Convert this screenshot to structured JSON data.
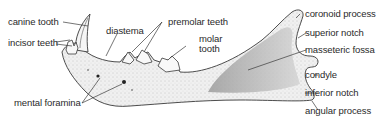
{
  "diagram": {
    "colors": {
      "bone_fill": "#ededed",
      "bone_stroke": "#3a3a3a",
      "fossa_shade": "#b8b8b8",
      "text": "#2a2a2a",
      "leader": "#3a3a3a"
    },
    "labels": {
      "canine_tooth": "canine tooth",
      "incisor_teeth": "incisor teeth",
      "diastema": "diastema",
      "premolar_teeth": "premolar teeth",
      "molar_tooth_line1": "molar",
      "molar_tooth_line2": "tooth",
      "mental_foramina": "mental foramina",
      "coronoid_process": "coronoid process",
      "superior_notch": "superior notch",
      "masseteric_fossa": "masseteric fossa",
      "condyle": "condyle",
      "inferior_notch": "inferior notch",
      "angular_process": "angular process"
    }
  }
}
